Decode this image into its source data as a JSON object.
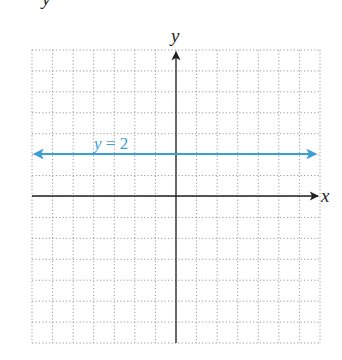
{
  "chart_data": {
    "type": "line",
    "title": "",
    "xlabel": "x",
    "ylabel": "y",
    "xlim": [
      -7,
      7
    ],
    "ylim": [
      -7,
      7
    ],
    "grid": true,
    "grid_style": "dotted",
    "tick_labels": false,
    "series": [
      {
        "name": "y = 2",
        "equation": "y = 2",
        "color": "#3a9fd4",
        "arrows_both_ends": true,
        "x": [
          -7,
          7
        ],
        "values": [
          2,
          2
        ]
      }
    ],
    "annotations": [
      {
        "text": "y = 2",
        "x": -4.5,
        "y": 2.5
      }
    ]
  },
  "labels": {
    "x_axis": "x",
    "y_axis": "y",
    "line": {
      "var": "y",
      "eq": " = 2"
    },
    "top_fragment": "y"
  },
  "colors": {
    "axis": "#231f20",
    "grid": "#9a9a9a",
    "line": "#3a9fd4"
  }
}
